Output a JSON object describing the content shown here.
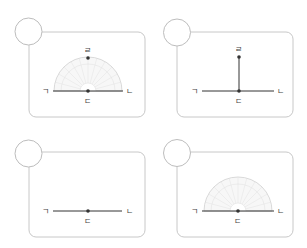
{
  "colors": {
    "box_border": "#c8c8c8",
    "circle_border": "#bdbdbd",
    "line": "#333333",
    "protractor": "#d6d6d6",
    "label": "#444444"
  },
  "panels": [
    {
      "id": "top-left",
      "answer_circle": "",
      "labels": {
        "left": "ㄱ",
        "right": "ㄴ",
        "center": "ㄷ",
        "top": "ㄹ"
      },
      "content": "protractor-with-point"
    },
    {
      "id": "top-right",
      "answer_circle": "",
      "labels": {
        "left": "ㄱ",
        "right": "ㄴ",
        "center": "ㄷ",
        "top": "ㄹ"
      },
      "content": "perpendicular-line"
    },
    {
      "id": "bottom-left",
      "answer_circle": "",
      "labels": {
        "left": "ㄱ",
        "right": "ㄴ",
        "center": "ㄷ"
      },
      "content": "line-only"
    },
    {
      "id": "bottom-right",
      "answer_circle": "",
      "labels": {
        "left": "ㄱ",
        "right": "ㄴ",
        "center": "ㄷ"
      },
      "content": "protractor-on-line"
    }
  ]
}
